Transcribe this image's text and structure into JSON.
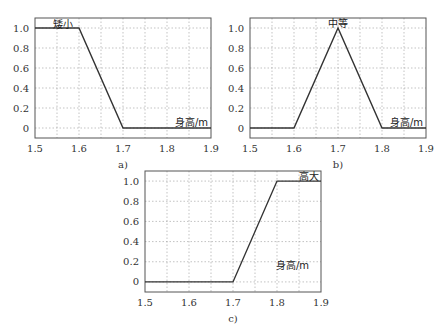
{
  "chart_data": [
    {
      "type": "line",
      "id": "a",
      "caption": "a)",
      "title": "",
      "series": [
        {
          "name": "矮小",
          "x": [
            1.5,
            1.6,
            1.7,
            1.9
          ],
          "y": [
            1.0,
            1.0,
            0,
            0
          ]
        }
      ],
      "annotations": [
        "矮小",
        "身高/m"
      ],
      "xlabel": "身高/m",
      "ylabel": "",
      "xlim": [
        1.5,
        1.9
      ],
      "ylim": [
        -0.1,
        1.1
      ],
      "xticks": [
        "1.5",
        "1.6",
        "1.7",
        "1.8",
        "1.9"
      ],
      "yticks": [
        "0",
        "0.2",
        "0.4",
        "0.6",
        "0.8",
        "1.0"
      ],
      "grid": true,
      "box": {
        "left": 35,
        "top": 18,
        "right": 211,
        "bottom": 138
      }
    },
    {
      "type": "line",
      "id": "b",
      "caption": "b)",
      "title": "",
      "series": [
        {
          "name": "中等",
          "x": [
            1.5,
            1.6,
            1.7,
            1.8,
            1.9
          ],
          "y": [
            0,
            0,
            1.0,
            0,
            0
          ]
        }
      ],
      "annotations": [
        "中等",
        "身高/m"
      ],
      "xlabel": "身高/m",
      "ylabel": "",
      "xlim": [
        1.5,
        1.9
      ],
      "ylim": [
        -0.1,
        1.1
      ],
      "xticks": [
        "1.5",
        "1.6",
        "1.7",
        "1.8",
        "1.9"
      ],
      "yticks": [
        "0",
        "0.2",
        "0.4",
        "0.6",
        "0.8",
        "1.0"
      ],
      "grid": true,
      "box": {
        "left": 250,
        "top": 18,
        "right": 426,
        "bottom": 138
      }
    },
    {
      "type": "line",
      "id": "c",
      "caption": "c)",
      "title": "",
      "series": [
        {
          "name": "高大",
          "x": [
            1.5,
            1.7,
            1.8,
            1.9
          ],
          "y": [
            0,
            0,
            1.0,
            1.0
          ]
        }
      ],
      "annotations": [
        "高大",
        "身高/m"
      ],
      "xlabel": "身高/m",
      "ylabel": "",
      "xlim": [
        1.5,
        1.9
      ],
      "ylim": [
        -0.1,
        1.1
      ],
      "xticks": [
        "1.5",
        "1.6",
        "1.7",
        "1.8",
        "1.9"
      ],
      "yticks": [
        "0",
        "0.2",
        "0.4",
        "0.6",
        "0.8",
        "1.0"
      ],
      "grid": true,
      "box": {
        "left": 145,
        "top": 171,
        "right": 321,
        "bottom": 292
      }
    }
  ],
  "colors": {
    "line": "#333333",
    "grid": "#9a9a9a",
    "frame": "#555555"
  }
}
